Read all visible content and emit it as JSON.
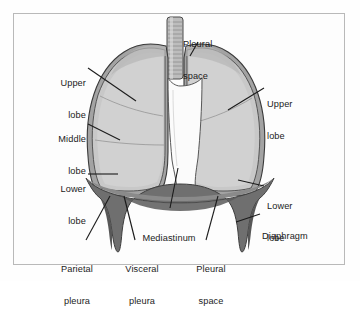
{
  "figure": {
    "background_color": "#fefefe",
    "frame_color": "#b9b9b9",
    "text_color": "#1b1b1b",
    "palette": {
      "lung_fill": "#c6c6c6",
      "lung_fill_light": "#d2d2d2",
      "pleura_band": "#a8a8a8",
      "outline": "#3a3a3a",
      "diaphragm": "#6f6f6f",
      "diaphragm_dark": "#5a5a5a",
      "mediastinum": "#fbfbfb",
      "trachea": "#bdbdbd"
    }
  },
  "labels": [
    {
      "id": "upper-lobe-left",
      "text": "Upper\nlobe",
      "line1": "Upper",
      "line2": "lobe",
      "align": "right",
      "x": 34,
      "y": 57,
      "w": 52
    },
    {
      "id": "middle-lobe",
      "text": "Middle\nlobe",
      "line1": "Middle",
      "line2": "lobe",
      "align": "right",
      "x": 30,
      "y": 113,
      "w": 56
    },
    {
      "id": "lower-lobe-left",
      "text": "Lower\nlobe",
      "line1": "Lower",
      "line2": "lobe",
      "align": "right",
      "x": 32,
      "y": 163,
      "w": 54
    },
    {
      "id": "pleural-space-top",
      "text": "Pleural\nspace",
      "line1": "Pleural",
      "line2": "space",
      "align": "left",
      "x": 183,
      "y": 18,
      "w": 52
    },
    {
      "id": "upper-lobe-right",
      "text": "Upper\nlobe",
      "line1": "Upper",
      "line2": "lobe",
      "align": "left",
      "x": 267,
      "y": 78,
      "w": 52
    },
    {
      "id": "lower-lobe-right",
      "text": "Lower\nlobe",
      "line1": "Lower",
      "line2": "lobe",
      "align": "left",
      "x": 267,
      "y": 180,
      "w": 52
    },
    {
      "id": "diaphragm",
      "text": "Diaphragm",
      "line1": "Diaphragm",
      "line2": "",
      "align": "left",
      "x": 262,
      "y": 210,
      "w": 70
    },
    {
      "id": "mediastinum",
      "text": "Mediastinum",
      "line1": "Mediastinum",
      "line2": "",
      "align": "center",
      "x": 128,
      "y": 212,
      "w": 82
    },
    {
      "id": "parietal-pleura",
      "text": "Parietal\npleura",
      "line1": "Parietal",
      "line2": "pleura",
      "align": "center",
      "x": 48,
      "y": 243,
      "w": 58
    },
    {
      "id": "visceral-pleura",
      "text": "Visceral\npleura",
      "line1": "Visceral",
      "line2": "pleura",
      "align": "center",
      "x": 113,
      "y": 243,
      "w": 58
    },
    {
      "id": "pleural-space-bottom",
      "text": "Pleural\nspace",
      "line1": "Pleural",
      "line2": "space",
      "align": "center",
      "x": 184,
      "y": 243,
      "w": 54
    }
  ],
  "structures": [
    {
      "name": "trachea",
      "description": "ringed airway at top center"
    },
    {
      "name": "right-lung",
      "description": "left side of image, three lobes"
    },
    {
      "name": "left-lung",
      "description": "right side of image, two lobes"
    },
    {
      "name": "pleural-membrane",
      "description": "gray band enclosing each lung"
    },
    {
      "name": "mediastinum",
      "description": "white central space between lungs"
    },
    {
      "name": "diaphragm",
      "description": "dark dome-shaped muscle below lungs"
    }
  ]
}
